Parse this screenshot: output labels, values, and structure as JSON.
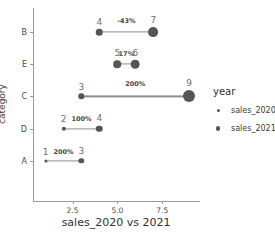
{
  "chart_data": {
    "type": "scatter",
    "title": "",
    "xlabel": "sales_2020 vs 2021",
    "ylabel": "category",
    "xlim": [
      0.3,
      9.6
    ],
    "xticks": [
      "2.5",
      "5.0",
      "7.5"
    ],
    "xtick_values": [
      2.5,
      5.0,
      7.5
    ],
    "grid": false,
    "categories": [
      "B",
      "E",
      "C",
      "D",
      "A"
    ],
    "series": [
      {
        "name": "sales_2020",
        "values": [
          4,
          5,
          3,
          2,
          1
        ]
      },
      {
        "name": "sales_2021",
        "values": [
          7,
          6,
          9,
          4,
          3
        ]
      }
    ],
    "points": [
      {
        "category": "B",
        "start": 4,
        "end": 7,
        "start_label": "4",
        "end_label": "7",
        "pct_label": "-43%"
      },
      {
        "category": "E",
        "start": 5,
        "end": 6,
        "start_label": "5",
        "end_label": "6",
        "pct_label": "17%"
      },
      {
        "category": "C",
        "start": 3,
        "end": 9,
        "start_label": "3",
        "end_label": "9",
        "pct_label": "200%"
      },
      {
        "category": "D",
        "start": 2,
        "end": 4,
        "start_label": "2",
        "end_label": "4",
        "pct_label": "100%"
      },
      {
        "category": "A",
        "start": 1,
        "end": 3,
        "start_label": "1",
        "end_label": "3",
        "pct_label": "200%"
      }
    ],
    "legend": {
      "title": "year",
      "position": "right",
      "entries": [
        "sales_2020",
        "sales_2021"
      ]
    },
    "colors": {
      "marker": "#555555",
      "connector": "#8d8d8d",
      "axis": "#9a9a9a",
      "text": "#3b3b3b"
    }
  },
  "caption": ""
}
